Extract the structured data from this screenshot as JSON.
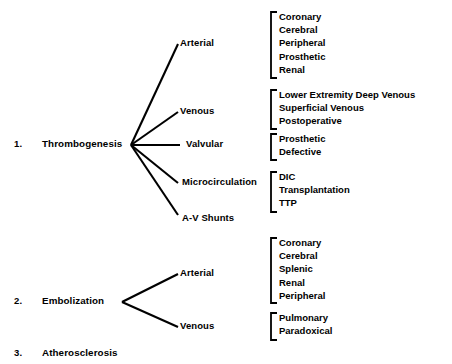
{
  "document": {
    "title_partial": "",
    "background_color": "#ffffff",
    "ink_color": "#000000"
  },
  "sections": [
    {
      "number": "1.",
      "label": "Thrombogenesis",
      "branches": [
        {
          "label": "Arterial",
          "leaves": [
            "Coronary",
            "Cerebral",
            "Peripheral",
            "Prosthetic",
            "Renal"
          ]
        },
        {
          "label": "Venous",
          "leaves": [
            "Lower Extremity Deep Venous",
            "Superficial Venous",
            "Postoperative"
          ]
        },
        {
          "label": "Valvular",
          "leaves": [
            "Prosthetic",
            "Defective"
          ]
        },
        {
          "label": "Microcirculation",
          "leaves": [
            "DIC",
            "Transplantation",
            "TTP"
          ]
        },
        {
          "label": "A-V Shunts",
          "leaves": []
        }
      ]
    },
    {
      "number": "2.",
      "label": "Embolization",
      "branches": [
        {
          "label": "Arterial",
          "leaves": [
            "Coronary",
            "Cerebral",
            "Splenic",
            "Renal",
            "Peripheral"
          ]
        },
        {
          "label": "Venous",
          "leaves": [
            "Pulmonary",
            "Paradoxical"
          ]
        }
      ]
    },
    {
      "number": "3.",
      "label": "Atherosclerosis",
      "branches": []
    }
  ]
}
